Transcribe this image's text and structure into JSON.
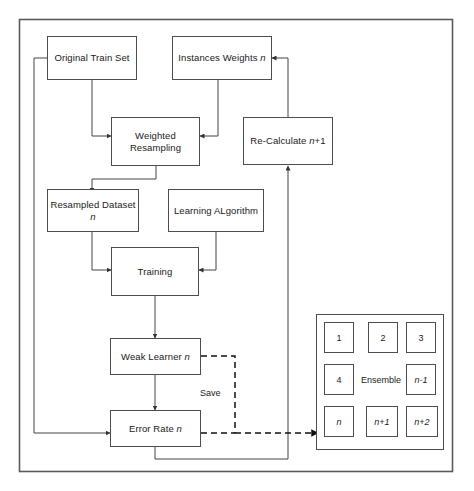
{
  "diagram": {
    "type": "flowchart",
    "outer_frame": {
      "name": "diagram-border"
    },
    "nodes": [
      {
        "id": "original-train-set",
        "label": "Original Train Set",
        "italic_suffix": ""
      },
      {
        "id": "instances-weights",
        "label": "Instances Weights ",
        "italic_suffix": "n"
      },
      {
        "id": "weighted-resampling",
        "label_line1": "Weighted",
        "label_line2": "Resampling"
      },
      {
        "id": "re-calculate",
        "label": "Re-Calculate ",
        "italic_suffix": "n",
        "plain_suffix": "+1"
      },
      {
        "id": "resampled-dataset",
        "label": "Resampled Dataset ",
        "italic_suffix": "n"
      },
      {
        "id": "learning-algorithm",
        "label": "Learning ALgorithm",
        "italic_suffix": ""
      },
      {
        "id": "training",
        "label": "Training",
        "italic_suffix": ""
      },
      {
        "id": "weak-learner",
        "label": "Weak Learner ",
        "italic_suffix": "n"
      },
      {
        "id": "error-rate",
        "label": "Error Rate ",
        "italic_suffix": "n"
      }
    ],
    "edge_labels": [
      {
        "id": "save-label",
        "text": "Save"
      }
    ],
    "ensemble": {
      "title": "Ensemble",
      "cells": [
        {
          "id": "cell-1",
          "text": "1",
          "italic": false
        },
        {
          "id": "cell-2",
          "text": "2",
          "italic": false
        },
        {
          "id": "cell-3",
          "text": "3",
          "italic": false
        },
        {
          "id": "cell-4",
          "text": "4",
          "italic": false
        },
        {
          "id": "cell-n-minus-1",
          "text": "n-1",
          "italic": true
        },
        {
          "id": "cell-n",
          "text": "n",
          "italic": true
        },
        {
          "id": "cell-n-plus-1",
          "text": "n+1",
          "italic": true
        },
        {
          "id": "cell-n-plus-2",
          "text": "n+2",
          "italic": true
        }
      ]
    },
    "colors": {
      "stroke": "#4d4d4d",
      "text": "#1a1a1a",
      "background": "#ffffff"
    },
    "connections": [
      {
        "from": "original-train-set",
        "to": "weighted-resampling",
        "style": "solid"
      },
      {
        "from": "instances-weights",
        "to": "weighted-resampling",
        "style": "solid"
      },
      {
        "from": "weighted-resampling",
        "to": "resampled-dataset",
        "style": "solid"
      },
      {
        "from": "resampled-dataset",
        "to": "training",
        "style": "solid"
      },
      {
        "from": "learning-algorithm",
        "to": "training",
        "style": "solid"
      },
      {
        "from": "training",
        "to": "weak-learner",
        "style": "solid"
      },
      {
        "from": "weak-learner",
        "to": "error-rate",
        "style": "solid"
      },
      {
        "from": "original-train-set",
        "to": "error-rate",
        "style": "solid"
      },
      {
        "from": "error-rate",
        "to": "re-calculate",
        "style": "solid"
      },
      {
        "from": "re-calculate",
        "to": "instances-weights",
        "style": "solid"
      },
      {
        "from": "weak-learner",
        "to": "cell-n",
        "style": "dashed",
        "label": "Save"
      },
      {
        "from": "error-rate",
        "to": "cell-n",
        "style": "dashed",
        "label": "Save"
      }
    ]
  },
  "top_artifact": {
    "text": ""
  }
}
